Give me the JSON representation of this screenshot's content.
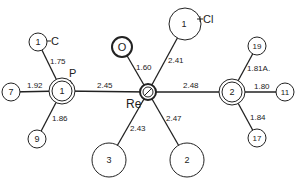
{
  "diagram": {
    "type": "molecular-structure",
    "central_atom": "Re",
    "atoms": [
      {
        "id": "re",
        "label": "",
        "name_label": "Re"
      },
      {
        "id": "p1",
        "label": "1",
        "name_label": "P"
      },
      {
        "id": "p2",
        "label": "2",
        "name_label": ""
      },
      {
        "id": "o",
        "label": "O",
        "name_label": ""
      },
      {
        "id": "cl",
        "label": "1",
        "name_label": "Cl"
      },
      {
        "id": "c1",
        "label": "1",
        "name_label": "C"
      },
      {
        "id": "c7",
        "label": "7",
        "name_label": ""
      },
      {
        "id": "c9",
        "label": "9",
        "name_label": ""
      },
      {
        "id": "c3",
        "label": "3",
        "name_label": ""
      },
      {
        "id": "c2",
        "label": "2",
        "name_label": ""
      },
      {
        "id": "c19",
        "label": "19",
        "name_label": ""
      },
      {
        "id": "c11",
        "label": "11",
        "name_label": ""
      },
      {
        "id": "c17",
        "label": "17",
        "name_label": ""
      }
    ],
    "bonds": [
      {
        "from": "p1",
        "to": "c1",
        "length": "1.75"
      },
      {
        "from": "p1",
        "to": "c7",
        "length": "1.92"
      },
      {
        "from": "p1",
        "to": "c9",
        "length": "1.86"
      },
      {
        "from": "p1",
        "to": "re",
        "length": "2.45"
      },
      {
        "from": "re",
        "to": "o",
        "length": "1.60"
      },
      {
        "from": "re",
        "to": "cl",
        "length": "2.41"
      },
      {
        "from": "re",
        "to": "p2",
        "length": "2.48"
      },
      {
        "from": "re",
        "to": "c3",
        "length": "2.43"
      },
      {
        "from": "re",
        "to": "c2",
        "length": "2.47"
      },
      {
        "from": "p2",
        "to": "c19",
        "length": "1.81A."
      },
      {
        "from": "p2",
        "to": "c11",
        "length": "1.80"
      },
      {
        "from": "p2",
        "to": "c17",
        "length": "1.84"
      }
    ]
  }
}
